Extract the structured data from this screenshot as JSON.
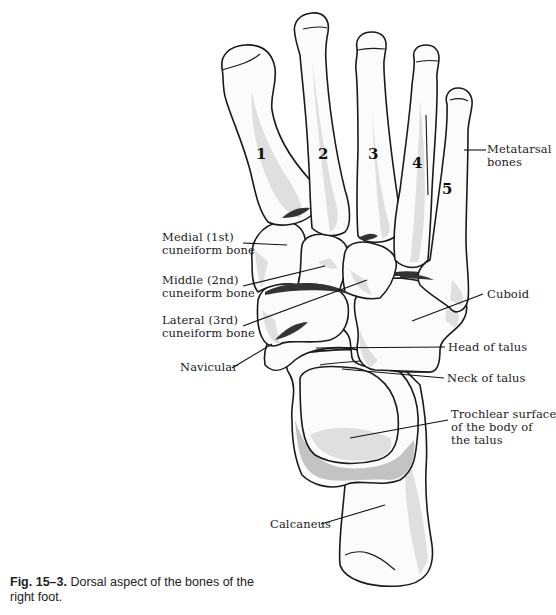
{
  "figure": {
    "type": "anatomical-illustration",
    "subject": "Dorsal aspect of the bones of the right foot",
    "metatarsal_numbers": [
      "1",
      "2",
      "3",
      "4",
      "5"
    ],
    "labels": {
      "metatarsal": "Metatarsal\nbones",
      "metatarsal_line1": "Metatarsal",
      "metatarsal_line2": "bones",
      "medial_cuneiform_line1": "Medial (1st)",
      "medial_cuneiform_line2": "cuneiform bone",
      "middle_cuneiform_line1": "Middle (2nd)",
      "middle_cuneiform_line2": "cuneiform bone",
      "lateral_cuneiform_line1": "Lateral (3rd)",
      "lateral_cuneiform_line2": "cuneiform bone",
      "navicular": "Navicular",
      "cuboid": "Cuboid",
      "head_of_talus": "Head of talus",
      "neck_of_talus": "Neck of talus",
      "trochlear_line1": "Trochlear surface",
      "trochlear_line2": "of the body of",
      "trochlear_line3": "the talus",
      "calcaneus": "Calcaneus"
    },
    "colors": {
      "outline": "#1a1a1a",
      "bone_fill": "#fbfbfb",
      "shading": "#d9d9d9",
      "joint_dark": "#333333"
    }
  },
  "caption": {
    "fig_number": "Fig. 15–3.",
    "text": "Dorsal aspect of the bones of the right foot."
  }
}
